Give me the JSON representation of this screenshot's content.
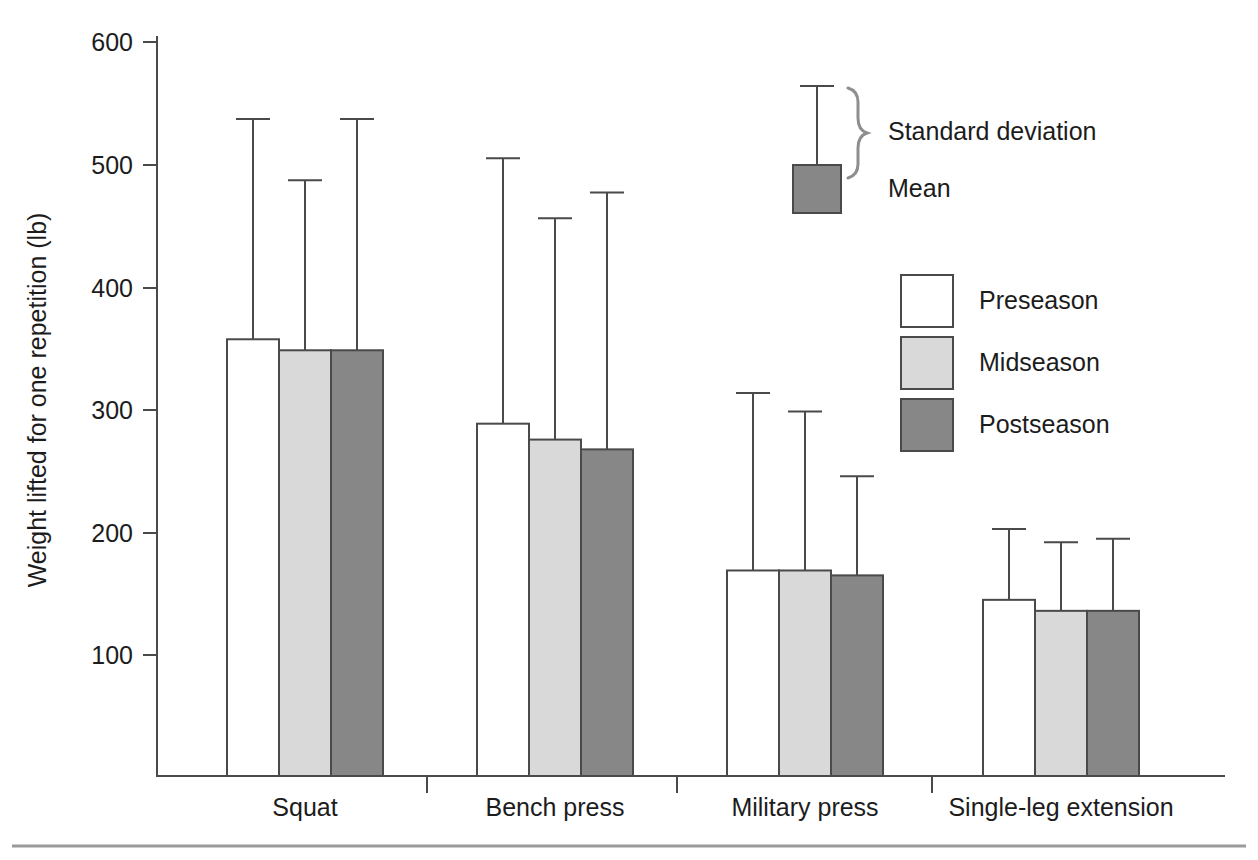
{
  "chart_data": {
    "type": "bar",
    "title": "",
    "xlabel": "",
    "ylabel": "Weight lifted for one repetition (lb)",
    "ylim": [
      0,
      600
    ],
    "yticks": [
      100,
      200,
      300,
      400,
      500,
      600
    ],
    "ytick_labels": [
      "100",
      "200",
      "300",
      "400",
      "500",
      "600"
    ],
    "grid": false,
    "legend_position": "upper right",
    "categories": [
      "Squat",
      "Bench press",
      "Military press",
      "Single-leg extension"
    ],
    "series": [
      {
        "name": "Preseason",
        "color": "#ffffff",
        "values": [
          357,
          288,
          168,
          144
        ],
        "errors_upper": [
          537,
          505,
          313,
          202
        ]
      },
      {
        "name": "Midseason",
        "color": "#d9d9d9",
        "values": [
          348,
          275,
          168,
          135
        ],
        "errors_upper": [
          487,
          456,
          298,
          191
        ]
      },
      {
        "name": "Postseason",
        "color": "#878787",
        "values": [
          348,
          267,
          164,
          135
        ],
        "errors_upper": [
          537,
          477,
          245,
          194
        ]
      }
    ],
    "error_type": "Standard deviation",
    "annotations": [
      {
        "name": "standard-deviation",
        "label": "Standard deviation"
      },
      {
        "name": "mean",
        "label": "Mean"
      }
    ]
  },
  "legend": {
    "annotation_items": [
      {
        "label": "Standard deviation",
        "marker": "errorbar-with-brace"
      },
      {
        "label": "Mean",
        "marker": "filled-square"
      }
    ],
    "series_items": [
      {
        "label": "Preseason",
        "swatch": "#ffffff"
      },
      {
        "label": "Midseason",
        "swatch": "#d9d9d9"
      },
      {
        "label": "Postseason",
        "swatch": "#878787"
      }
    ]
  },
  "colors": {
    "preseason": "#ffffff",
    "midseason": "#d9d9d9",
    "postseason": "#878787",
    "outline": "#4a4a4a",
    "text": "#1c1c1c",
    "brace": "#8e8e8e"
  }
}
